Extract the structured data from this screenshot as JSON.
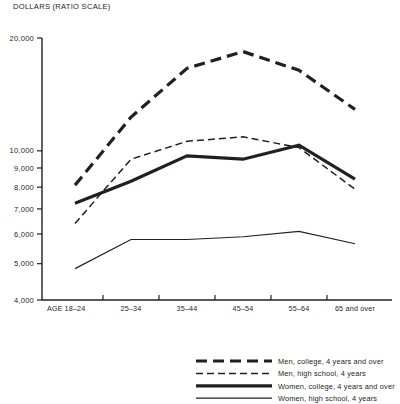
{
  "chart_data": {
    "type": "line",
    "title": "",
    "ylabel": "DOLLARS (RATIO SCALE)",
    "xlabel": "AGE",
    "scale": "log",
    "grid": false,
    "legend_position": "bottom-right",
    "categories": [
      "18–24",
      "25–34",
      "35–44",
      "45–54",
      "55–64",
      "65 and over"
    ],
    "ylim": [
      4000,
      20000
    ],
    "yticks": [
      4000,
      5000,
      6000,
      7000,
      8000,
      9000,
      10000,
      20000
    ],
    "ytick_labels": [
      "4,000",
      "5,000",
      "6,000",
      "7,000",
      "8,000",
      "9,000",
      "10,000",
      "20,000"
    ],
    "series": [
      {
        "name": "Men, college, 4 years and over",
        "style": "thick-dashed",
        "values": [
          8100,
          12300,
          16600,
          18400,
          16400,
          12900
        ]
      },
      {
        "name": "Men, high school, 4 years",
        "style": "thin-dashed",
        "values": [
          6400,
          9500,
          10600,
          10900,
          10200,
          7900
        ]
      },
      {
        "name": "Women, college, 4 years and over",
        "style": "thick-solid",
        "values": [
          7250,
          8300,
          9700,
          9500,
          10350,
          8400
        ]
      },
      {
        "name": "Women, high school, 4 years",
        "style": "thin-solid",
        "values": [
          4850,
          5800,
          5800,
          5900,
          6100,
          5650
        ]
      }
    ]
  },
  "axis": {
    "y_caption": "DOLLARS (RATIO SCALE)",
    "x_caption": "AGE"
  },
  "colors": {
    "ink": "#231f20",
    "background": "#ffffff"
  }
}
